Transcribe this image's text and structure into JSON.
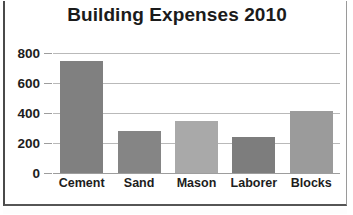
{
  "chart_data": {
    "type": "bar",
    "title": "Building Expenses 2010",
    "xlabel": "",
    "ylabel": "",
    "categories": [
      "Cement",
      "Sand",
      "Mason",
      "Laborer",
      "Blocks"
    ],
    "values": [
      750,
      280,
      350,
      240,
      415
    ],
    "ytick_labels": [
      "800",
      "600",
      "400",
      "200",
      "0"
    ],
    "ytick_values": [
      800,
      600,
      400,
      200,
      0
    ],
    "ylim": [
      0,
      800
    ],
    "grid": "horizontal",
    "legend": "none",
    "bar_colors": [
      "#808080",
      "#858585",
      "#a9a9a9",
      "#7d7d7d",
      "#9b9b9b"
    ],
    "series": [
      {
        "name": "Expenses",
        "values": [
          750,
          280,
          350,
          240,
          415
        ]
      }
    ]
  },
  "style": {
    "background": "#ffffff",
    "text_color": "#1d1d1d",
    "gridline_color": "#b9b9b9",
    "axis_color": "#9d9d9d",
    "frame_color": "#4a4a4a"
  }
}
